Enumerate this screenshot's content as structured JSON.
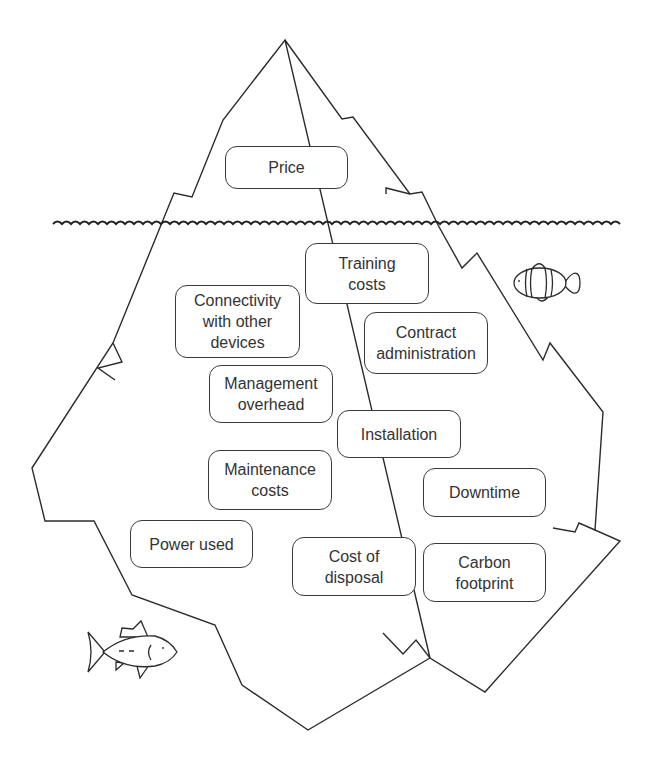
{
  "diagram": {
    "type": "iceberg",
    "colors": {
      "stroke": "#2b2b2b",
      "text": "#333333",
      "background": "#ffffff"
    },
    "above_water": [
      {
        "id": "price",
        "label": "Price"
      }
    ],
    "below_water": [
      {
        "id": "training-costs",
        "label": "Training\ncosts"
      },
      {
        "id": "connectivity",
        "label": "Connectivity\nwith other\ndevices"
      },
      {
        "id": "contract-administration",
        "label": "Contract\nadministration"
      },
      {
        "id": "management-overhead",
        "label": "Management\noverhead"
      },
      {
        "id": "installation",
        "label": "Installation"
      },
      {
        "id": "maintenance-costs",
        "label": "Maintenance\ncosts"
      },
      {
        "id": "downtime",
        "label": "Downtime"
      },
      {
        "id": "power-used",
        "label": "Power used"
      },
      {
        "id": "cost-of-disposal",
        "label": "Cost of\ndisposal"
      },
      {
        "id": "carbon-footprint",
        "label": "Carbon\nfootprint"
      }
    ],
    "decorations": {
      "water_line": "wavy-waterline",
      "fish_left": "tuna-fish-icon",
      "fish_right": "clownfish-icon"
    }
  }
}
